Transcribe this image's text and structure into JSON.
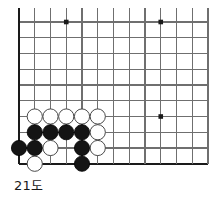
{
  "figure": {
    "caption": "21도",
    "kind": "go-board-corner-diagram"
  },
  "board": {
    "origin_x": 19,
    "origin_y": 22,
    "spacing": 15.75,
    "cols": 13,
    "rows": 10,
    "stone_radius": 7.6,
    "line_color": "#6f6f6f",
    "edge_color": "#1a1a1a",
    "edge_width": 2.2,
    "line_width": 1.1,
    "background": "#ffffff",
    "left_edge_col": 0,
    "bottom_edge_row": 9,
    "top_clipped": true,
    "right_clipped": true
  },
  "star_points": [
    {
      "col": 3,
      "row": 0
    },
    {
      "col": 9,
      "row": 0
    },
    {
      "col": 9,
      "row": 6
    }
  ],
  "stones": [
    {
      "col": 1,
      "row": 6,
      "color": "white"
    },
    {
      "col": 2,
      "row": 6,
      "color": "white"
    },
    {
      "col": 3,
      "row": 6,
      "color": "white"
    },
    {
      "col": 4,
      "row": 6,
      "color": "white"
    },
    {
      "col": 5,
      "row": 6,
      "color": "white"
    },
    {
      "col": 1,
      "row": 7,
      "color": "black"
    },
    {
      "col": 2,
      "row": 7,
      "color": "black"
    },
    {
      "col": 3,
      "row": 7,
      "color": "black"
    },
    {
      "col": 4,
      "row": 7,
      "color": "black"
    },
    {
      "col": 5,
      "row": 7,
      "color": "white"
    },
    {
      "col": 0,
      "row": 8,
      "color": "black"
    },
    {
      "col": 1,
      "row": 8,
      "color": "black"
    },
    {
      "col": 2,
      "row": 8,
      "color": "white"
    },
    {
      "col": 4,
      "row": 8,
      "color": "black"
    },
    {
      "col": 5,
      "row": 8,
      "color": "white"
    },
    {
      "col": 1,
      "row": 9,
      "color": "white"
    },
    {
      "col": 4,
      "row": 9,
      "color": "black"
    }
  ],
  "colors": {
    "black_fill": "#141414",
    "black_stroke": "#000000",
    "white_fill": "#ffffff",
    "white_stroke": "#4a4a4a",
    "star_fill": "#1a1a1a",
    "caption_text": "#1a1a1a"
  }
}
